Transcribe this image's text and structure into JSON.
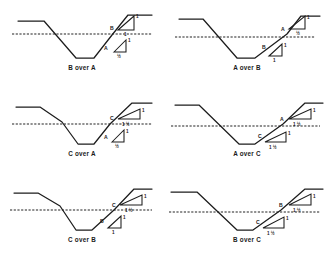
{
  "figure": {
    "type": "slope-comparison-diagram-grid",
    "rows": 3,
    "cols": 2,
    "line_color": "#1c1c1c",
    "datum_color": "#222222",
    "background": "#ffffff"
  },
  "slope_grades": {
    "A": "1/2",
    "B": "1",
    "C": "1 1/2"
  },
  "panels": [
    {
      "id": "b-over-a",
      "caption": "B over A",
      "upper": {
        "label": "B",
        "rise": "1",
        "run": "1"
      },
      "lower": {
        "label": "A",
        "rise": "1",
        "run": "½"
      }
    },
    {
      "id": "a-over-b",
      "caption": "A over B",
      "upper": {
        "label": "A",
        "rise": "1",
        "run": "½"
      },
      "lower": {
        "label": "B",
        "rise": "1",
        "run": "1"
      }
    },
    {
      "id": "c-over-a",
      "caption": "C over A",
      "upper": {
        "label": "C",
        "rise": "1",
        "run": "1 ½"
      },
      "lower": {
        "label": "A",
        "rise": "1",
        "run": "½"
      }
    },
    {
      "id": "a-over-c",
      "caption": "A over C",
      "upper": {
        "label": "A",
        "rise": "1",
        "run": "1 ½"
      },
      "lower": {
        "label": "C",
        "rise": "1",
        "run": "1 ½"
      }
    },
    {
      "id": "c-over-b",
      "caption": "C over B",
      "upper": {
        "label": "C",
        "rise": "1",
        "run": "1 ½"
      },
      "lower": {
        "label": "B",
        "rise": "1",
        "run": "1"
      }
    },
    {
      "id": "b-over-c",
      "caption": "B over C",
      "upper": {
        "label": "B",
        "rise": "1",
        "run": "1 ½"
      },
      "lower": {
        "label": "C",
        "rise": "1",
        "run": "1 ½"
      }
    }
  ]
}
